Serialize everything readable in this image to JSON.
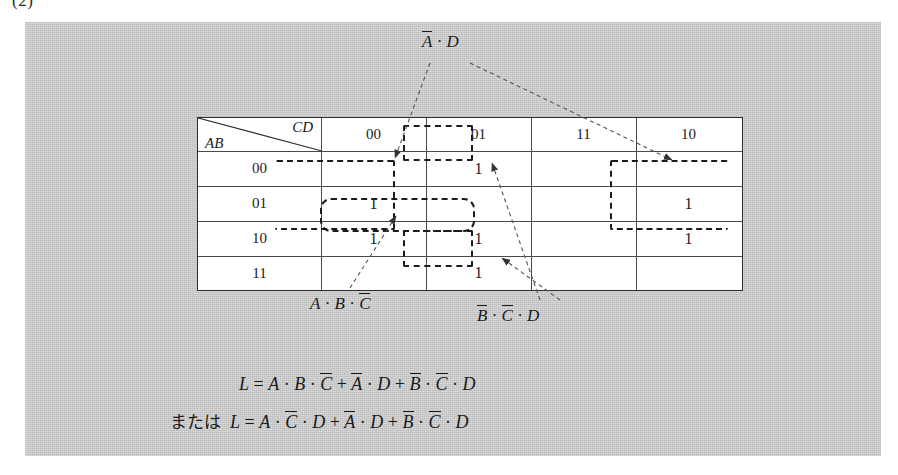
{
  "figure": {
    "number": "(2)"
  },
  "kmap": {
    "corner": {
      "col_var": "CD",
      "row_var": "AB"
    },
    "col_headers": [
      "00",
      "01",
      "11",
      "10"
    ],
    "row_headers": [
      "00",
      "01",
      "10",
      "11"
    ],
    "cells": [
      [
        "",
        "1",
        "",
        ""
      ],
      [
        "1",
        "",
        "",
        "1"
      ],
      [
        "1",
        "1",
        "",
        "1"
      ],
      [
        "",
        "1",
        "",
        ""
      ]
    ]
  },
  "annotations": [
    {
      "id": "a-not-d",
      "text": "Ā · D",
      "plain": "notA . D"
    },
    {
      "id": "abc-not",
      "text": "A · B · C̄",
      "plain": "A . B . notC"
    },
    {
      "id": "bcd-not",
      "text": "B̄ · C̄ · D",
      "plain": "notB . notC . D"
    }
  ],
  "equations": {
    "line1": "L = A · B · C̄ + Ā · D + B̄ · C̄ · D",
    "line2_prefix": "または",
    "line2": "L = A · C̄ · D + Ā · D + B̄ · C̄ · D"
  },
  "colors": {
    "panel_background": "#cbcbcb",
    "table_background": "#ffffff",
    "ink": "#1b1b1b",
    "grid_line": "#4a4a4a",
    "dashed_group": "#1c1c1c",
    "leader_line": "#555555"
  }
}
